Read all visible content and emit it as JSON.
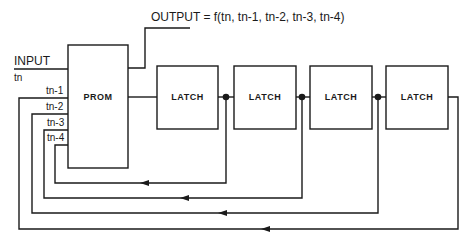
{
  "diagram": {
    "output_label": "OUTPUT =  f(tn, tn-1, tn-2, tn-3, tn-4)",
    "input_label": "INPUT",
    "input_sub": "tn",
    "prom_label": "PROM",
    "prom_inputs": [
      "tn-1",
      "tn-2",
      "tn-3",
      "tn-4"
    ],
    "latches": [
      {
        "label": "LATCH"
      },
      {
        "label": "LATCH"
      },
      {
        "label": "LATCH"
      },
      {
        "label": "LATCH"
      }
    ],
    "line_color": "#1a1a1a",
    "background": "#ffffff"
  }
}
